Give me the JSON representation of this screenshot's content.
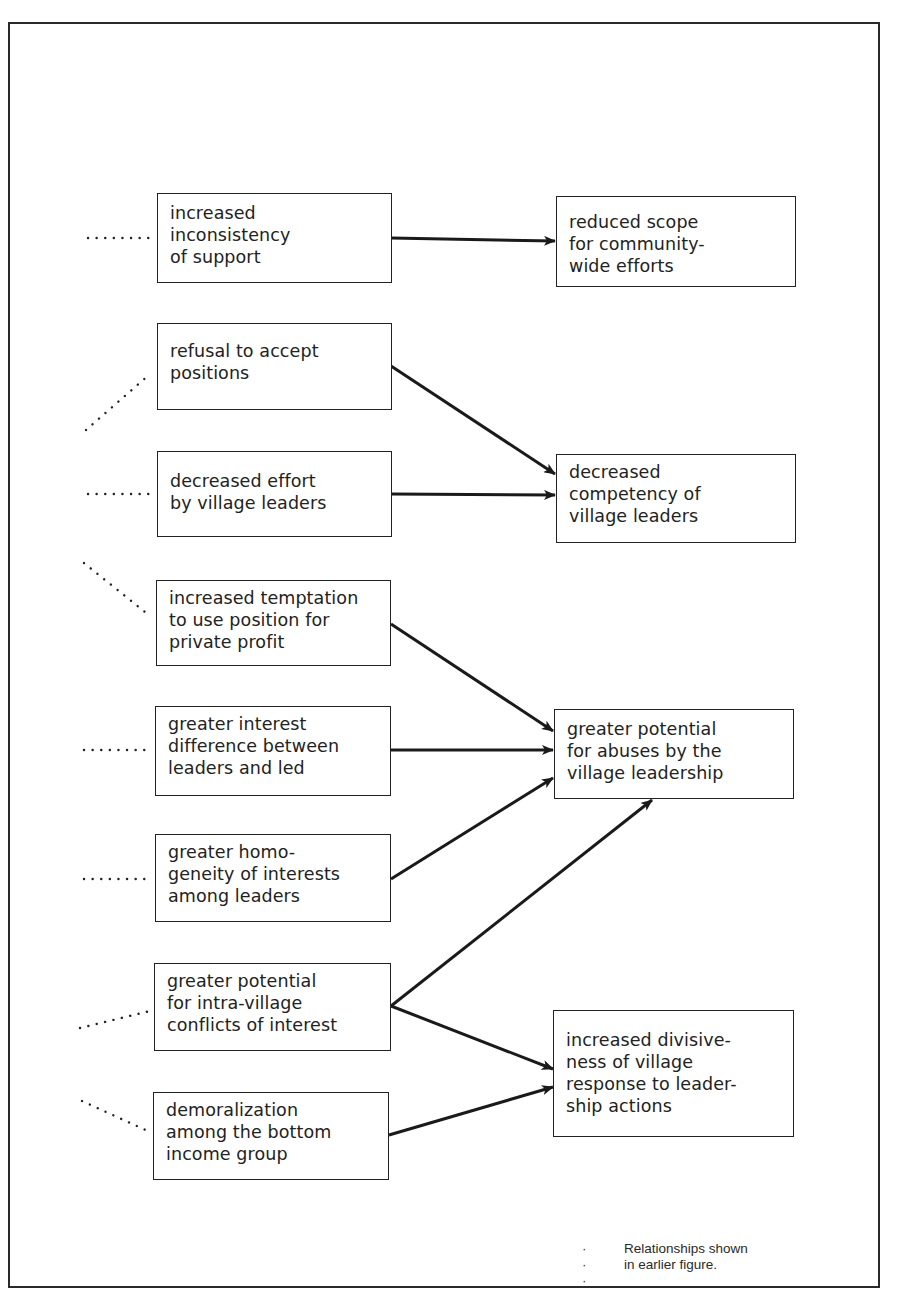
{
  "figure": {
    "title": "",
    "legend": {
      "symbol": "· · ·",
      "lines": [
        "Relationships shown",
        "in earlier figure."
      ]
    }
  },
  "nodes": {
    "left": [
      {
        "id": "increased-inconsistency-of-support",
        "lines": [
          "increased",
          "inconsistency",
          "of support"
        ]
      },
      {
        "id": "refusal-to-accept-positions",
        "lines": [
          "refusal to accept",
          "positions"
        ]
      },
      {
        "id": "decreased-effort-by-village-leaders",
        "lines": [
          "decreased effort",
          "by village leaders"
        ]
      },
      {
        "id": "increased-temptation-private-profit",
        "lines": [
          "increased temptation",
          "to use position for",
          "private profit"
        ]
      },
      {
        "id": "greater-interest-difference",
        "lines": [
          "greater interest",
          "difference between",
          "leaders and led"
        ]
      },
      {
        "id": "greater-homogeneity-of-interests",
        "lines": [
          "greater homo-",
          "geneity of interests",
          "among leaders"
        ]
      },
      {
        "id": "greater-potential-intra-village-conflicts",
        "lines": [
          "greater potential",
          "for intra-village",
          "conflicts of interest"
        ]
      },
      {
        "id": "demoralization-bottom-income-group",
        "lines": [
          "demoralization",
          "among the bottom",
          "income group"
        ]
      }
    ],
    "right": [
      {
        "id": "reduced-scope-community-wide-efforts",
        "lines": [
          "reduced scope",
          "for community-",
          "wide efforts"
        ]
      },
      {
        "id": "decreased-competency-of-village-leaders",
        "lines": [
          "decreased",
          "competency of",
          "village leaders"
        ]
      },
      {
        "id": "greater-potential-for-abuses",
        "lines": [
          "greater potential",
          "for abuses by the",
          "village leadership"
        ]
      },
      {
        "id": "increased-divisiveness",
        "lines": [
          "increased divisive-",
          "ness of village",
          "response to leader-",
          "ship actions"
        ]
      }
    ]
  },
  "edges": [
    {
      "from": "increased-inconsistency-of-support",
      "to": "reduced-scope-community-wide-efforts"
    },
    {
      "from": "refusal-to-accept-positions",
      "to": "decreased-competency-of-village-leaders"
    },
    {
      "from": "decreased-effort-by-village-leaders",
      "to": "decreased-competency-of-village-leaders"
    },
    {
      "from": "increased-temptation-private-profit",
      "to": "greater-potential-for-abuses"
    },
    {
      "from": "greater-interest-difference",
      "to": "greater-potential-for-abuses"
    },
    {
      "from": "greater-homogeneity-of-interests",
      "to": "greater-potential-for-abuses"
    },
    {
      "from": "greater-potential-intra-village-conflicts",
      "to": "greater-potential-for-abuses"
    },
    {
      "from": "greater-potential-intra-village-conflicts",
      "to": "increased-divisiveness"
    },
    {
      "from": "demoralization-bottom-income-group",
      "to": "increased-divisiveness"
    }
  ],
  "dotted_inputs": [
    {
      "to": "increased-inconsistency-of-support",
      "direction": "horizontal"
    },
    {
      "to": "refusal-to-accept-positions",
      "direction": "from-lower-left"
    },
    {
      "to": "decreased-effort-by-village-leaders",
      "direction": "horizontal"
    },
    {
      "to": "increased-temptation-private-profit",
      "direction": "from-upper-left"
    },
    {
      "to": "greater-interest-difference",
      "direction": "horizontal"
    },
    {
      "to": "greater-homogeneity-of-interests",
      "direction": "horizontal"
    },
    {
      "to": "greater-potential-intra-village-conflicts",
      "direction": "from-lower-left"
    },
    {
      "to": "demoralization-bottom-income-group",
      "direction": "from-upper-left"
    }
  ],
  "colors": {
    "ink": "#222222",
    "paper": "#ffffff"
  }
}
